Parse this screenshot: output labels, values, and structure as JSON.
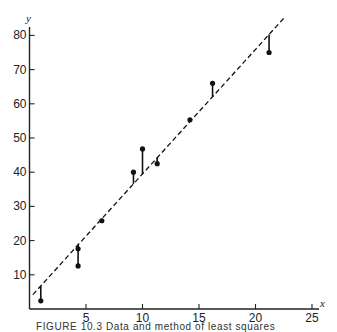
{
  "chart_data": {
    "type": "scatter",
    "title": "",
    "xlabel": "x",
    "ylabel": "y",
    "xlim": [
      0,
      25
    ],
    "ylim": [
      0,
      85
    ],
    "x_ticks": [
      5,
      10,
      15,
      20,
      25
    ],
    "y_ticks": [
      10,
      20,
      30,
      40,
      50,
      60,
      70,
      80
    ],
    "grid": false,
    "legend": null,
    "series": [
      {
        "name": "data points",
        "points": [
          {
            "x": 1.0,
            "y": 2.4
          },
          {
            "x": 4.3,
            "y": 17.6
          },
          {
            "x": 4.3,
            "y": 12.6
          },
          {
            "x": 6.4,
            "y": 25.8
          },
          {
            "x": 9.2,
            "y": 40.0
          },
          {
            "x": 10.0,
            "y": 46.8
          },
          {
            "x": 11.3,
            "y": 42.5
          },
          {
            "x": 14.2,
            "y": 55.3
          },
          {
            "x": 16.2,
            "y": 66.0
          },
          {
            "x": 21.2,
            "y": 75.0
          }
        ]
      },
      {
        "name": "fitted line (dashed)",
        "line": {
          "x0": 0.3,
          "y0": 4.2,
          "x1": 22.5,
          "y1": 85.0
        }
      }
    ],
    "annotations": "vertical segments (residuals) connect each data point to the dashed fitted line"
  },
  "caption": "FIGURE 10.3   Data and method of least squares"
}
